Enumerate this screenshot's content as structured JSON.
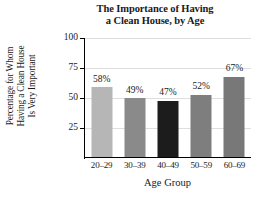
{
  "chart_data": {
    "type": "bar",
    "title": "The Importance of Having a Clean House, by Age",
    "title_lines": [
      "The Importance of Having",
      "a Clean House, by Age"
    ],
    "xlabel": "Age Group",
    "ylabel": "Percentage for Whom Having a Clean House Is Very Important",
    "ylabel_lines": [
      "Percentage for Whom",
      "Having a Clean House",
      "Is Very Important"
    ],
    "categories": [
      "20–29",
      "30–39",
      "40–49",
      "50–59",
      "60–69"
    ],
    "values": [
      58,
      49,
      47,
      52,
      67
    ],
    "value_labels": [
      "58%",
      "49%",
      "47%",
      "52%",
      "67%"
    ],
    "bar_colors": [
      "#b6b6b6",
      "#8a8a8a",
      "#1c1c1c",
      "#7e7e7e",
      "#787878"
    ],
    "ylim": [
      0,
      100
    ],
    "yticks": [
      25,
      50,
      75,
      100
    ],
    "ytick_labels": [
      "25",
      "50",
      "75",
      "100"
    ],
    "grid": true,
    "grid_color": "#dedede",
    "legend": "none",
    "axis_color": "#000000"
  }
}
